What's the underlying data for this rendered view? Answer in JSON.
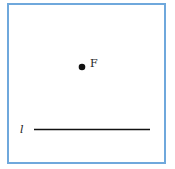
{
  "diagram": {
    "frame_color": "#6fa8dc",
    "point": {
      "label": "F",
      "x": 82,
      "y": 67
    },
    "line": {
      "label": "l",
      "x1": 34,
      "x2": 150,
      "y": 129.5
    }
  }
}
